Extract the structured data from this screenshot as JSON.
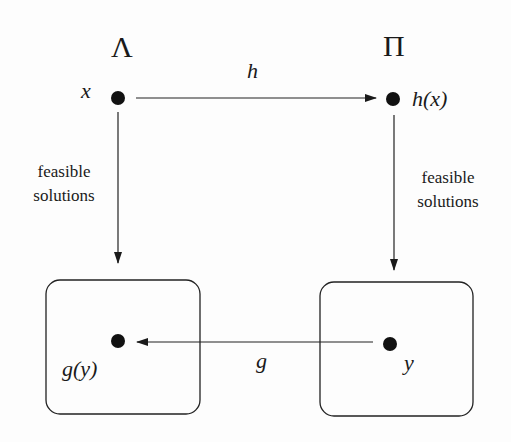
{
  "diagram": {
    "nodes": {
      "lambda": {
        "label": "Λ"
      },
      "pi": {
        "label": "Π"
      },
      "x": {
        "label": "x"
      },
      "hx": {
        "label": "h(x)"
      },
      "y": {
        "label": "y"
      },
      "gy": {
        "label": "g(y)"
      }
    },
    "edges": {
      "h": {
        "label": "h",
        "from": "x",
        "to": "h(x)"
      },
      "g": {
        "label": "g",
        "from": "y",
        "to": "g(y)"
      },
      "left_feasible": {
        "label_line1": "feasible",
        "label_line2": "solutions",
        "from": "x",
        "to": "left-solution-set"
      },
      "right_feasible": {
        "label_line1": "feasible",
        "label_line2": "solutions",
        "from": "h(x)",
        "to": "right-solution-set"
      }
    },
    "colors": {
      "ink": "#1a1a1a",
      "background": "#fdfdfd"
    }
  }
}
